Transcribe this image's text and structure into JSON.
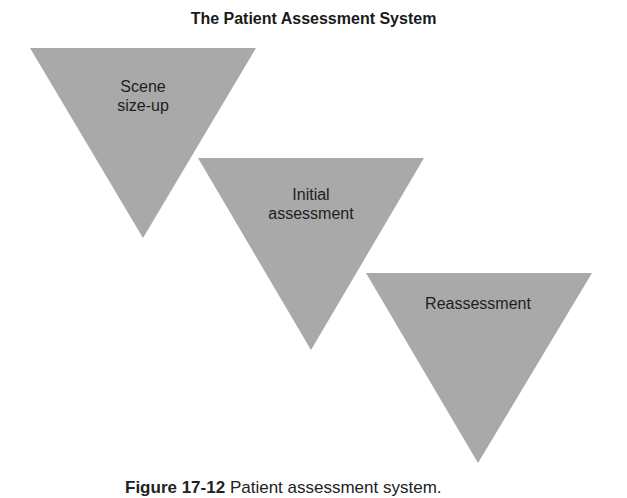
{
  "title": "The Patient Assessment System",
  "fill_color": "#a9a9a9",
  "steps": [
    {
      "line1": "Scene",
      "line2": "size-up",
      "points": "30,48 256,48 143,238"
    },
    {
      "line1": "Initial",
      "line2": "assessment",
      "points": "198,158 424,158 311,350"
    },
    {
      "line1": "Reassessment",
      "line2": "",
      "points": "366,273 592,273 478,463"
    }
  ],
  "caption": {
    "figure": "Figure 17-12",
    "text": "Patient assessment system."
  }
}
